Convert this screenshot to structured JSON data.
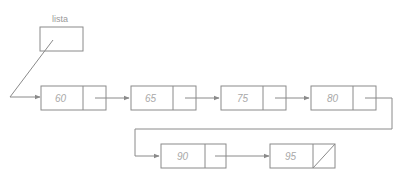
{
  "diagram": {
    "type": "singly-linked-list",
    "head_label": "lista",
    "nodes": [
      {
        "value": "60"
      },
      {
        "value": "65"
      },
      {
        "value": "75"
      },
      {
        "value": "80"
      },
      {
        "value": "90"
      },
      {
        "value": "95",
        "next": "null"
      }
    ],
    "colors": {
      "stroke": "#8a8a8a",
      "text": "#a8a8a8"
    }
  }
}
